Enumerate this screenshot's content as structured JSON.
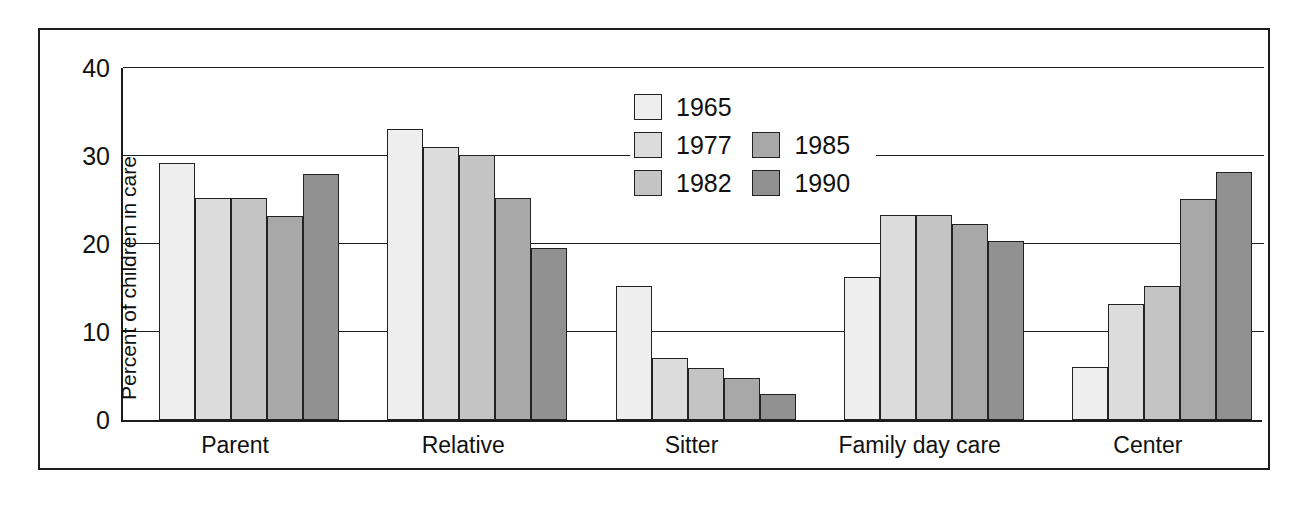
{
  "chart_data": {
    "type": "bar",
    "title": "",
    "subtitle": "",
    "xlabel": "",
    "ylabel": "Percent of children in care",
    "ylim": [
      0,
      40
    ],
    "yticks": [
      0,
      10,
      20,
      30,
      40
    ],
    "ytick_labels": [
      "0",
      "10",
      "20",
      "30",
      "40"
    ],
    "grid": true,
    "grid_axis": "y",
    "legend_position": "top-center",
    "categories": [
      "Parent",
      "Relative",
      "Sitter",
      "Family day care",
      "Center"
    ],
    "series": [
      {
        "name": "1965",
        "color": "#eeeeee",
        "values": [
          29.2,
          33.1,
          15.2,
          16.3,
          6.0
        ]
      },
      {
        "name": "1977",
        "color": "#dcdcdc",
        "values": [
          25.2,
          31.0,
          7.0,
          23.3,
          13.2
        ]
      },
      {
        "name": "1982",
        "color": "#c4c4c4",
        "values": [
          25.2,
          30.1,
          5.9,
          23.3,
          15.2
        ]
      },
      {
        "name": "1985",
        "color": "#a8a8a8",
        "values": [
          23.2,
          25.2,
          4.8,
          22.3,
          25.1
        ]
      },
      {
        "name": "1990",
        "color": "#919191",
        "values": [
          28.0,
          19.5,
          2.9,
          20.3,
          28.2
        ]
      }
    ]
  },
  "legend": {
    "column_left": [
      "1965",
      "1977",
      "1982"
    ],
    "column_right": [
      "1985",
      "1990"
    ]
  },
  "colors": {
    "axis": "#1c1c1c",
    "grid": "#1c1c1c",
    "background": "#ffffff",
    "bar_outline": "#222222"
  }
}
